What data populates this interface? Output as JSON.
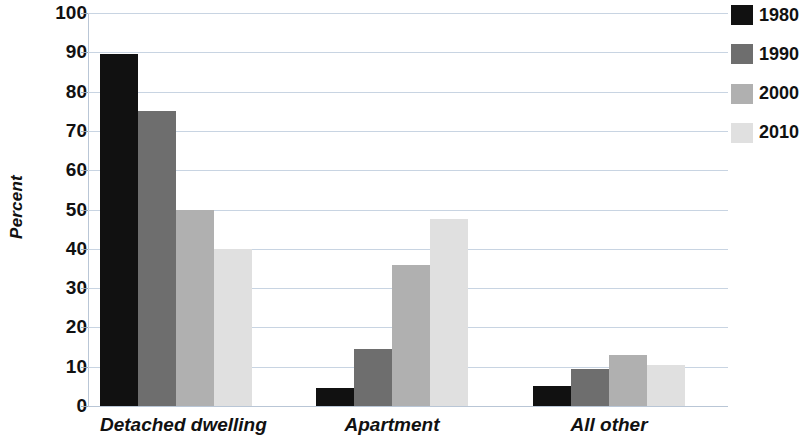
{
  "chart_data": {
    "type": "bar",
    "title": "",
    "xlabel": "",
    "ylabel": "Percent",
    "ylim": [
      0,
      100
    ],
    "ytick_step": 10,
    "ytick_labels": [
      "0",
      "10",
      "20",
      "30",
      "40",
      "50",
      "60",
      "70",
      "80",
      "90",
      "100"
    ],
    "grid": true,
    "legend_position": "top-right",
    "categories": [
      "Detached dwelling",
      "Apartment",
      "All other"
    ],
    "series": [
      {
        "name": "1980",
        "color": "#111111",
        "values": [
          89.5,
          4.5,
          5.0
        ]
      },
      {
        "name": "1990",
        "color": "#6e6e6e",
        "values": [
          75.0,
          14.5,
          9.5
        ]
      },
      {
        "name": "2000",
        "color": "#b0b0b0",
        "values": [
          50.0,
          36.0,
          13.0
        ]
      },
      {
        "name": "2010",
        "color": "#e0e0e0",
        "values": [
          40.0,
          47.5,
          10.5
        ]
      }
    ]
  },
  "legend": {
    "items": [
      {
        "label": "1980",
        "color": "#111111"
      },
      {
        "label": "1990",
        "color": "#6e6e6e"
      },
      {
        "label": "2000",
        "color": "#b0b0b0"
      },
      {
        "label": "2010",
        "color": "#e0e0e0"
      }
    ]
  },
  "axes": {
    "y_title": "Percent"
  }
}
